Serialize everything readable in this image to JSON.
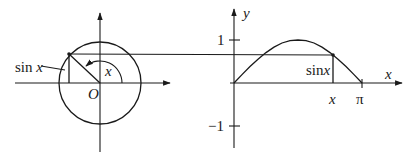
{
  "figure": {
    "left_panel": {
      "name": "unit-circle",
      "origin_label": "O",
      "angle_label": "x",
      "sine_label": "sin x",
      "angle_radians_approx": 2.35
    },
    "right_panel": {
      "name": "sine-graph",
      "y_axis_label": "y",
      "x_axis_label": "x",
      "y_ticks": [
        "1",
        "−1"
      ],
      "x_ticks": [
        "x",
        "π"
      ],
      "segment_label": "sin x",
      "curve": "y = sin x, 0 ≤ x ≤ π"
    }
  },
  "colors": {
    "ink": "#1a1a1a",
    "background": "#ffffff"
  }
}
